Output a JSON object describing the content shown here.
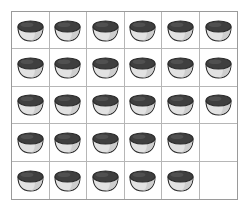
{
  "canvas": {
    "width": 250,
    "height": 216,
    "background_color": "#ffffff"
  },
  "grid": {
    "name": "bowl-inventory-grid",
    "columns": 6,
    "rows": 5,
    "outer_border_color": "#9a9a9a",
    "inner_line_color": "#b6b6b6",
    "cell_background_color": "#ffffff",
    "total_cells": 30,
    "filled_cells": 28,
    "empty_cells": 2
  },
  "icon": {
    "name": "bowl-icon",
    "description": "bowl with dark top opening and light gray body",
    "top_color": "#3f3f3f",
    "top_highlight_color": "#5a5a5a",
    "body_color": "#e2e2e2",
    "body_shade_color": "#c8c8c8",
    "outline_color": "#2b2b2b"
  },
  "cells": [
    [
      {
        "filled": true,
        "label": "bowl"
      },
      {
        "filled": true,
        "label": "bowl"
      },
      {
        "filled": true,
        "label": "bowl"
      },
      {
        "filled": true,
        "label": "bowl"
      },
      {
        "filled": true,
        "label": "bowl"
      },
      {
        "filled": true,
        "label": "bowl"
      }
    ],
    [
      {
        "filled": true,
        "label": "bowl"
      },
      {
        "filled": true,
        "label": "bowl"
      },
      {
        "filled": true,
        "label": "bowl"
      },
      {
        "filled": true,
        "label": "bowl"
      },
      {
        "filled": true,
        "label": "bowl"
      },
      {
        "filled": true,
        "label": "bowl"
      }
    ],
    [
      {
        "filled": true,
        "label": "bowl"
      },
      {
        "filled": true,
        "label": "bowl"
      },
      {
        "filled": true,
        "label": "bowl"
      },
      {
        "filled": true,
        "label": "bowl"
      },
      {
        "filled": true,
        "label": "bowl"
      },
      {
        "filled": true,
        "label": "bowl"
      }
    ],
    [
      {
        "filled": true,
        "label": "bowl"
      },
      {
        "filled": true,
        "label": "bowl"
      },
      {
        "filled": true,
        "label": "bowl"
      },
      {
        "filled": true,
        "label": "bowl"
      },
      {
        "filled": true,
        "label": "bowl"
      },
      {
        "filled": false,
        "label": "empty"
      }
    ],
    [
      {
        "filled": true,
        "label": "bowl"
      },
      {
        "filled": true,
        "label": "bowl"
      },
      {
        "filled": true,
        "label": "bowl"
      },
      {
        "filled": true,
        "label": "bowl"
      },
      {
        "filled": true,
        "label": "bowl"
      },
      {
        "filled": false,
        "label": "empty"
      }
    ]
  ]
}
